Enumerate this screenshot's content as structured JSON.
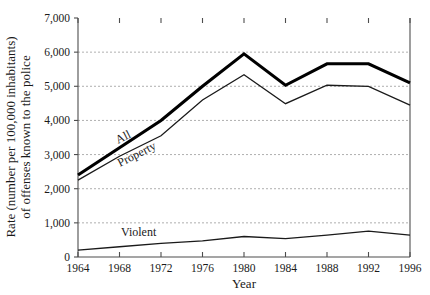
{
  "chart_data": {
    "type": "line",
    "title": "",
    "xlabel": "Year",
    "ylabel": "Rate (number per 100,000 inhabitants) of offenses known to the police",
    "ylabel_line1": "Rate (number per 100,000 inhabitants)",
    "ylabel_line2": "of offenses known to the police",
    "x": [
      1964,
      1968,
      1972,
      1976,
      1980,
      1984,
      1988,
      1992,
      1996
    ],
    "xtick_labels": [
      "1964",
      "1968",
      "1972",
      "1976",
      "1980",
      "1984",
      "1988",
      "1992",
      "1996"
    ],
    "ytick_labels": [
      "0",
      "1,000",
      "2,000",
      "3,000",
      "4,000",
      "5,000",
      "6,000",
      "7,000"
    ],
    "ytick_values": [
      0,
      1000,
      2000,
      3000,
      4000,
      5000,
      6000,
      7000
    ],
    "xlim": [
      1964,
      1996
    ],
    "ylim": [
      0,
      7000
    ],
    "grid": "horizontal-dotted",
    "legend": "inline-labels",
    "series": [
      {
        "name": "All",
        "label": "All",
        "color": "#000000",
        "stroke_width": 3.1,
        "values": [
          2400,
          3200,
          4000,
          5000,
          5950,
          5030,
          5660,
          5660,
          5100
        ]
      },
      {
        "name": "Property",
        "label": "Property",
        "color": "#1a1a1a",
        "stroke_width": 1.3,
        "values": [
          2250,
          2950,
          3550,
          4600,
          5340,
          4490,
          5030,
          5000,
          4450
        ]
      },
      {
        "name": "Violent",
        "label": "Violent",
        "color": "#1a1a1a",
        "stroke_width": 1.3,
        "values": [
          200,
          300,
          400,
          470,
          600,
          540,
          640,
          760,
          640
        ]
      }
    ]
  }
}
